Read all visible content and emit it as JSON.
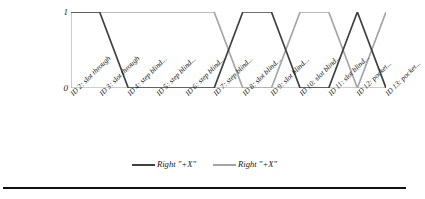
{
  "chart_data": {
    "type": "line",
    "title": "",
    "xlabel": "",
    "ylabel": "",
    "ylim": [
      0,
      1
    ],
    "yticks": [
      0,
      1
    ],
    "ytick_labels": [
      "0",
      "1"
    ],
    "grid": false,
    "legend_position": "bottom",
    "categories": [
      "ID 2: slot through",
      "ID 3: slot through",
      "ID 4: step blind...",
      "ID 5: step blind...",
      "ID 6: step blind...",
      "ID 7: step blind...",
      "ID 8: slot blind...",
      "ID 9: slot blind...",
      "ID 10: slot blind...",
      "ID 11: slot blind...",
      "ID 12: pocket...",
      "ID 13: pocket..."
    ],
    "series": [
      {
        "name": "Right \"+X\"",
        "color": "#404040",
        "values": [
          1,
          1,
          0,
          0,
          0,
          0,
          1,
          1,
          0,
          0,
          1,
          0
        ]
      },
      {
        "name": "Right \"+X\"",
        "color": "#a6a6a6",
        "values": [
          1,
          1,
          1,
          1,
          1,
          1,
          0,
          0,
          1,
          1,
          0,
          1
        ]
      }
    ]
  },
  "axis": {
    "y_tick_1": "1",
    "y_tick_0": "0"
  },
  "legend": {
    "entries": [
      {
        "label": "Right \"+X\"",
        "color": "#404040"
      },
      {
        "label": "Right \"+X\"",
        "color": "#a6a6a6"
      }
    ]
  },
  "colors": {
    "series_dark": "#404040",
    "series_light": "#a6a6a6",
    "axis_line": "#9a9a9a",
    "rule": "#111111"
  }
}
